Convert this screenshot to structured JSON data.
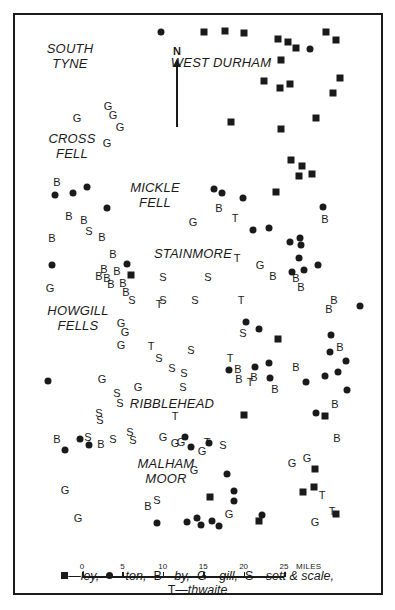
{
  "regions": [
    {
      "id": "south-tyne",
      "lines": [
        "SOUTH",
        "TYNE"
      ],
      "x": 70,
      "y": 56
    },
    {
      "id": "west-durham",
      "lines": [
        "WEST DURHAM"
      ],
      "x": 221,
      "y": 62
    },
    {
      "id": "cross-fell",
      "lines": [
        "CROSS",
        "FELL"
      ],
      "x": 72,
      "y": 146
    },
    {
      "id": "mickle-fell",
      "lines": [
        "MICKLE",
        "FELL"
      ],
      "x": 155,
      "y": 195
    },
    {
      "id": "stainmore",
      "lines": [
        "STAINMORE"
      ],
      "x": 193,
      "y": 253
    },
    {
      "id": "howgill-fells",
      "lines": [
        "HOWGILL",
        "FELLS"
      ],
      "x": 78,
      "y": 318
    },
    {
      "id": "ribblehead",
      "lines": [
        "RIBBLEHEAD"
      ],
      "x": 172,
      "y": 403
    },
    {
      "id": "malham-moor",
      "lines": [
        "MALHAM",
        "MOOR"
      ],
      "x": 166,
      "y": 471
    }
  ],
  "north_arrow": {
    "label": "N"
  },
  "markers": {
    "ley": [
      [
        204,
        32
      ],
      [
        225,
        31
      ],
      [
        244,
        33
      ],
      [
        278,
        39
      ],
      [
        288,
        42
      ],
      [
        296,
        48
      ],
      [
        326,
        32
      ],
      [
        336,
        40
      ],
      [
        281,
        60
      ],
      [
        264,
        81
      ],
      [
        280,
        88
      ],
      [
        290,
        84
      ],
      [
        340,
        78
      ],
      [
        333,
        93
      ],
      [
        316,
        118
      ],
      [
        281,
        129
      ],
      [
        231,
        122
      ],
      [
        291,
        160
      ],
      [
        302,
        166
      ],
      [
        299,
        176
      ],
      [
        312,
        174
      ],
      [
        276,
        192
      ],
      [
        131,
        275
      ],
      [
        278,
        339
      ],
      [
        244,
        415
      ],
      [
        325,
        416
      ],
      [
        315,
        469
      ],
      [
        303,
        492
      ],
      [
        314,
        487
      ],
      [
        336,
        514
      ],
      [
        210,
        497
      ],
      [
        259,
        521
      ]
    ],
    "ton": [
      [
        161,
        32
      ],
      [
        310,
        49
      ],
      [
        55,
        195
      ],
      [
        73,
        193
      ],
      [
        87,
        187
      ],
      [
        107,
        208
      ],
      [
        214,
        189
      ],
      [
        222,
        193
      ],
      [
        243,
        198
      ],
      [
        323,
        207
      ],
      [
        253,
        230
      ],
      [
        269,
        228
      ],
      [
        300,
        238
      ],
      [
        290,
        242
      ],
      [
        301,
        245
      ],
      [
        299,
        258
      ],
      [
        292,
        272
      ],
      [
        304,
        270
      ],
      [
        318,
        265
      ],
      [
        360,
        306
      ],
      [
        52,
        265
      ],
      [
        127,
        264
      ],
      [
        246,
        322
      ],
      [
        259,
        329
      ],
      [
        48,
        381
      ],
      [
        331,
        335
      ],
      [
        330,
        352
      ],
      [
        346,
        361
      ],
      [
        255,
        367
      ],
      [
        269,
        363
      ],
      [
        229,
        370
      ],
      [
        270,
        378
      ],
      [
        306,
        382
      ],
      [
        325,
        376
      ],
      [
        338,
        372
      ],
      [
        347,
        390
      ],
      [
        316,
        413
      ],
      [
        80,
        439
      ],
      [
        89,
        445
      ],
      [
        65,
        450
      ],
      [
        185,
        437
      ],
      [
        191,
        447
      ],
      [
        209,
        443
      ],
      [
        227,
        474
      ],
      [
        234,
        501
      ],
      [
        234,
        491
      ],
      [
        262,
        515
      ],
      [
        157,
        523
      ],
      [
        187,
        522
      ],
      [
        197,
        518
      ],
      [
        212,
        521
      ],
      [
        219,
        526
      ],
      [
        201,
        525
      ]
    ],
    "by": [
      [
        57,
        182
      ],
      [
        69,
        216
      ],
      [
        84,
        220
      ],
      [
        52,
        238
      ],
      [
        102,
        237
      ],
      [
        113,
        254
      ],
      [
        301,
        287
      ],
      [
        104,
        269
      ],
      [
        99,
        276
      ],
      [
        117,
        271
      ],
      [
        107,
        278
      ],
      [
        111,
        284
      ],
      [
        123,
        283
      ],
      [
        126,
        292
      ],
      [
        219,
        208
      ],
      [
        325,
        219
      ],
      [
        273,
        276
      ],
      [
        296,
        278
      ],
      [
        334,
        300
      ],
      [
        329,
        309
      ],
      [
        340,
        347
      ],
      [
        238,
        369
      ],
      [
        239,
        379
      ],
      [
        254,
        377
      ],
      [
        296,
        367
      ],
      [
        275,
        389
      ],
      [
        335,
        404
      ],
      [
        337,
        438
      ],
      [
        57,
        439
      ],
      [
        101,
        444
      ],
      [
        148,
        506
      ]
    ],
    "gill": [
      [
        77,
        118
      ],
      [
        108,
        106
      ],
      [
        113,
        115
      ],
      [
        120,
        127
      ],
      [
        107,
        143
      ],
      [
        193,
        222
      ],
      [
        260,
        265
      ],
      [
        50,
        288
      ],
      [
        121,
        323
      ],
      [
        125,
        332
      ],
      [
        121,
        345
      ],
      [
        102,
        379
      ],
      [
        138,
        387
      ],
      [
        202,
        451
      ],
      [
        163,
        437
      ],
      [
        194,
        470
      ],
      [
        65,
        490
      ],
      [
        78,
        518
      ],
      [
        175,
        443
      ],
      [
        181,
        442
      ],
      [
        229,
        514
      ],
      [
        292,
        463
      ],
      [
        307,
        458
      ],
      [
        315,
        522
      ]
    ],
    "sett_scale": [
      [
        89,
        231
      ],
      [
        163,
        277
      ],
      [
        208,
        277
      ],
      [
        163,
        300
      ],
      [
        195,
        300
      ],
      [
        132,
        300
      ],
      [
        159,
        358
      ],
      [
        172,
        368
      ],
      [
        184,
        373
      ],
      [
        183,
        387
      ],
      [
        117,
        393
      ],
      [
        120,
        403
      ],
      [
        100,
        420
      ],
      [
        99,
        413
      ],
      [
        130,
        432
      ],
      [
        88,
        437
      ],
      [
        113,
        439
      ],
      [
        133,
        440
      ],
      [
        223,
        445
      ],
      [
        157,
        500
      ],
      [
        243,
        333
      ],
      [
        191,
        350
      ]
    ],
    "thwaite": [
      [
        235,
        218
      ],
      [
        237,
        258
      ],
      [
        159,
        304
      ],
      [
        241,
        300
      ],
      [
        151,
        346
      ],
      [
        230,
        358
      ],
      [
        250,
        382
      ],
      [
        175,
        416
      ],
      [
        322,
        495
      ],
      [
        332,
        511
      ],
      [
        207,
        442
      ]
    ]
  },
  "scale_bar": {
    "ticks": [
      "0",
      "5",
      "10",
      "15",
      "20",
      "25"
    ],
    "unit": "MILES"
  },
  "legend": {
    "ley_label": "ley,",
    "ton_label": "ton,",
    "by_prefix": "B",
    "by_label": "by,",
    "gill_prefix": "G",
    "gill_label": "gill,",
    "sett_prefix": "S",
    "sett_label": "sett & scale,",
    "thwaite_prefix": "T",
    "thwaite_label": "thwaite",
    "dash": "—"
  },
  "colors": {
    "ink": "#1a1a1a",
    "paper": "#ffffff"
  }
}
